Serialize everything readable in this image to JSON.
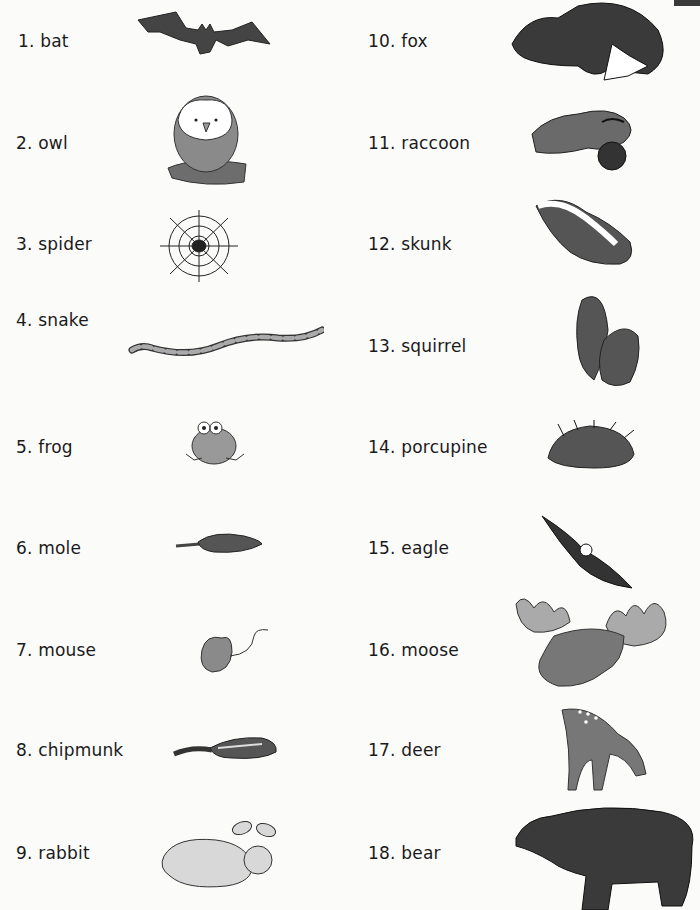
{
  "left_column": [
    {
      "number": "1.",
      "animal": "bat"
    },
    {
      "number": "2.",
      "animal": "owl"
    },
    {
      "number": "3.",
      "animal": "spider"
    },
    {
      "number": "4.",
      "animal": "snake"
    },
    {
      "number": "5.",
      "animal": "frog"
    },
    {
      "number": "6.",
      "animal": "mole"
    },
    {
      "number": "7.",
      "animal": "mouse"
    },
    {
      "number": "8.",
      "animal": "chipmunk"
    },
    {
      "number": "9.",
      "animal": "rabbit"
    }
  ],
  "right_column": [
    {
      "number": "10.",
      "animal": "fox"
    },
    {
      "number": "11.",
      "animal": "raccoon"
    },
    {
      "number": "12.",
      "animal": "skunk"
    },
    {
      "number": "13.",
      "animal": "squirrel"
    },
    {
      "number": "14.",
      "animal": "porcupine"
    },
    {
      "number": "15.",
      "animal": "eagle"
    },
    {
      "number": "16.",
      "animal": "moose"
    },
    {
      "number": "17.",
      "animal": "deer"
    },
    {
      "number": "18.",
      "animal": "bear"
    }
  ],
  "labels": {
    "l1": "1. bat",
    "l2": "2. owl",
    "l3": "3. spider",
    "l4": "4. snake",
    "l5": "5. frog",
    "l6": "6. mole",
    "l7": "7. mouse",
    "l8": "8. chipmunk",
    "l9": "9. rabbit",
    "r10": "10.  fox",
    "r11": "11. raccoon",
    "r12": "12.  skunk",
    "r13": "13.  squirrel",
    "r14": "14.  porcupine",
    "r15": "15.  eagle",
    "r16": "16.  moose",
    "r17": "17.  deer",
    "r18": "18.  bear"
  }
}
